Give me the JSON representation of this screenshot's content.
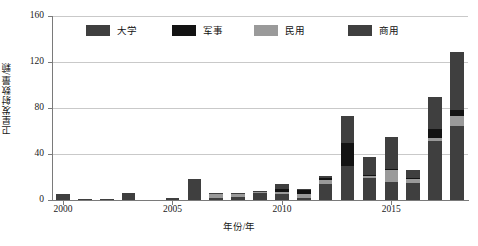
{
  "chart_data": {
    "type": "bar",
    "subtype": "stacked-vertical",
    "title": "",
    "xlabel": "年份/年",
    "ylabel": "卫星发射数量/颗",
    "ylim": [
      0,
      160
    ],
    "yticks": [
      0,
      40,
      80,
      120,
      160
    ],
    "xticks": [
      2000,
      2005,
      2010,
      2015
    ],
    "grid": "horizontal",
    "legend_position": "top-inside",
    "categories": [
      "2000",
      "2001",
      "2002",
      "2003",
      "2004",
      "2005",
      "2006",
      "2007",
      "2008",
      "2009",
      "2010",
      "2011",
      "2012",
      "2013",
      "2014",
      "2015",
      "2016",
      "2017",
      "2018"
    ],
    "series": [
      {
        "name": "商用",
        "color": "#3f3f3f",
        "values": [
          5,
          1,
          1,
          6,
          0,
          2,
          17,
          2,
          3,
          6,
          5,
          2,
          14,
          30,
          19,
          16,
          15,
          51,
          64
        ]
      },
      {
        "name": "民用",
        "color": "#9a9a9a",
        "values": [
          0,
          0,
          0,
          0,
          0,
          0,
          0,
          3,
          2,
          1,
          2,
          3,
          3,
          0,
          2,
          10,
          3,
          3,
          9
        ]
      },
      {
        "name": "军事",
        "color": "#131313",
        "values": [
          0,
          0,
          0,
          0,
          0,
          0,
          0,
          0,
          0,
          0,
          3,
          4,
          2,
          20,
          1,
          1,
          1,
          8,
          5
        ]
      },
      {
        "name": "大学",
        "color": "#3f3f3f",
        "values": [
          0,
          0,
          0,
          0,
          0,
          0,
          1,
          1,
          1,
          1,
          4,
          1,
          2,
          23,
          15,
          28,
          7,
          28,
          51
        ]
      }
    ],
    "totals": [
      5,
      1,
      1,
      6,
      0,
      2,
      18,
      6,
      6,
      8,
      14,
      10,
      21,
      73,
      37,
      55,
      26,
      90,
      129
    ]
  },
  "legend": {
    "items": [
      {
        "label": "大学",
        "color": "#3f3f3f",
        "icon": "legend-swatch-icon"
      },
      {
        "label": "军事",
        "color": "#131313",
        "icon": "legend-swatch-icon"
      },
      {
        "label": "民用",
        "color": "#9a9a9a",
        "icon": "legend-swatch-icon"
      },
      {
        "label": "商用",
        "color": "#3f3f3f",
        "icon": "legend-swatch-icon"
      }
    ]
  },
  "axes": {
    "y_title": "卫星发射数量/颗",
    "x_title": "年份/年",
    "y_tick_labels": [
      "0",
      "40",
      "80",
      "120",
      "160"
    ],
    "x_tick_labels": [
      "2000",
      "2005",
      "2010",
      "2015"
    ]
  },
  "style": {
    "background": "#ffffff",
    "grid_color": "#c9c9c9",
    "axis_color": "#7a7a7a",
    "text_color": "#1a1a1a"
  }
}
